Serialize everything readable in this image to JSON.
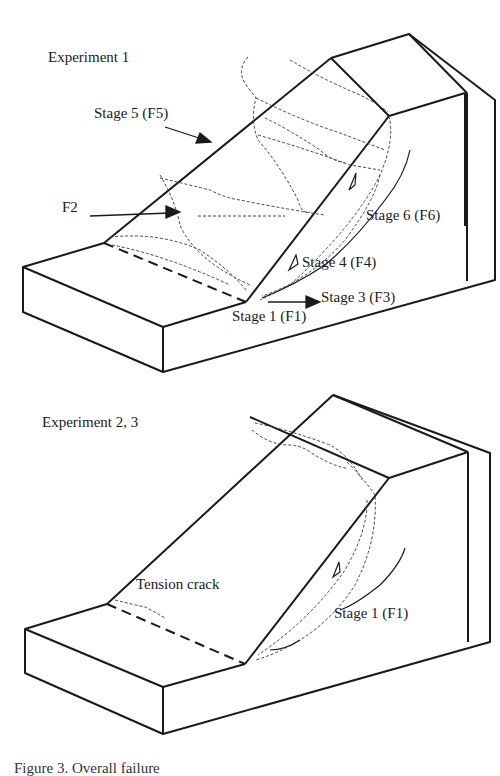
{
  "figure": {
    "caption_partial": "Figure 3. Overall failure"
  },
  "panels": [
    {
      "title": "Experiment 1",
      "labels": {
        "stage5": "Stage 5 (F5)",
        "f2": "F2",
        "stage6": "Stage 6 (F6)",
        "stage4": "Stage 4 (F4)",
        "stage3": "Stage 3 (F3)",
        "stage1": "Stage 1 (F1)"
      }
    },
    {
      "title": "Experiment 2, 3",
      "labels": {
        "tension_crack": "Tension crack",
        "stage1": "Stage 1 (F1)"
      }
    }
  ],
  "colors": {
    "line": "#1a1a1a",
    "crack": "#444444",
    "background": "#ffffff"
  }
}
